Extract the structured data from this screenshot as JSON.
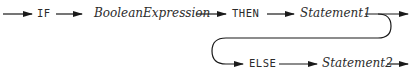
{
  "diagram": {
    "type": "syntax-railroad",
    "stroke_color": "#1a1a1a",
    "text_color": "#2b2b2b",
    "nodes": [
      {
        "id": "if",
        "kind": "keyword",
        "label": "IF"
      },
      {
        "id": "boolexpr",
        "kind": "nonterminal",
        "label": "BooleanExpression"
      },
      {
        "id": "then",
        "kind": "keyword",
        "label": "THEN"
      },
      {
        "id": "stmt1",
        "kind": "nonterminal",
        "label": "Statement1"
      },
      {
        "id": "else",
        "kind": "keyword",
        "label": "ELSE"
      },
      {
        "id": "stmt2",
        "kind": "nonterminal",
        "label": "Statement2"
      }
    ],
    "edges": [
      {
        "from": "start",
        "to": "if"
      },
      {
        "from": "if",
        "to": "boolexpr"
      },
      {
        "from": "boolexpr",
        "to": "then"
      },
      {
        "from": "then",
        "to": "stmt1"
      },
      {
        "from": "stmt1",
        "to": "end"
      },
      {
        "from": "stmt1",
        "to": "else",
        "note": "optional loop"
      },
      {
        "from": "else",
        "to": "stmt2"
      },
      {
        "from": "stmt2",
        "to": "end"
      }
    ]
  }
}
